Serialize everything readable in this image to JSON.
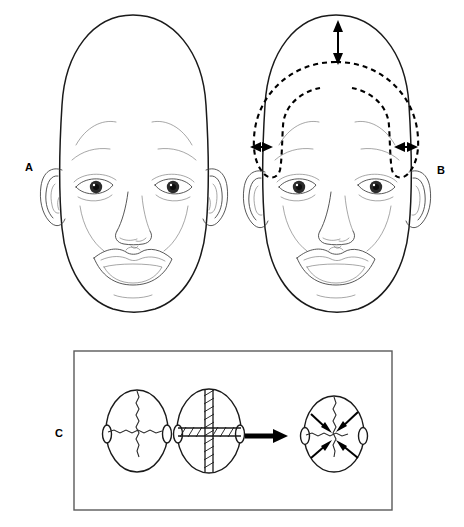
{
  "figure": {
    "background_color": "#ffffff",
    "line_color": "#1a1a1a",
    "width": 464,
    "height": 527
  },
  "panels": [
    {
      "id": "A",
      "label": "A",
      "caption": "Frontal view of infant with scaphocephaly: elongated, narrow skull",
      "label_x": 25,
      "label_y": 171
    },
    {
      "id": "B",
      "label": "B",
      "caption": "Same frontal view with dashed outline showing desired normal cranial contour and arrows indicating vertical height reduction and bilateral width expansion",
      "label_x": 437,
      "label_y": 174
    },
    {
      "id": "C",
      "label": "C",
      "caption": "Superior views of the skull: normal sutures, fused sagittal suture, resulting restricted transverse growth",
      "label_x": 55,
      "label_y": 437
    }
  ],
  "annotations": {
    "vertical_arrow": {
      "name": "height-reduction-arrow",
      "orientation": "vertical",
      "double_headed": true,
      "x": 338,
      "y_top": 23,
      "y_bottom": 62
    },
    "left_arrow": {
      "name": "left-width-expansion-arrow",
      "orientation": "horizontal",
      "double_headed": true,
      "y": 147,
      "x_left": 252,
      "x_right": 271
    },
    "right_arrow": {
      "name": "right-width-expansion-arrow",
      "orientation": "horizontal",
      "double_headed": true,
      "y": 147,
      "x_left": 396,
      "x_right": 416
    },
    "transition_arrow": {
      "name": "transition-arrow",
      "orientation": "horizontal-right",
      "x_start": 245,
      "x_end": 286,
      "y": 436
    }
  },
  "panel_c": {
    "border": {
      "x": 74,
      "y": 351,
      "width": 318,
      "height": 159
    },
    "skulls": [
      {
        "name": "skull-normal-sutures",
        "label": "normal sutures",
        "cx": 137,
        "cy": 431,
        "rx": 31,
        "ry": 41,
        "sutures_fused": false,
        "arrows": false
      },
      {
        "name": "skull-fused-sagittal-suture",
        "label": "fused sutures (hatched)",
        "cx": 209,
        "cy": 431,
        "rx": 32,
        "ry": 42,
        "sutures_fused": true,
        "arrows": false
      },
      {
        "name": "skull-restricted-growth",
        "label": "restricted transverse growth",
        "cx": 334,
        "cy": 434,
        "rx": 30,
        "ry": 38,
        "sutures_fused": false,
        "arrows": true
      }
    ]
  },
  "icons": {
    "double_arrow": "double-headed-arrow-icon",
    "block_arrow": "block-arrow-right-icon",
    "growth_arrow": "inward-growth-arrow-icon"
  }
}
